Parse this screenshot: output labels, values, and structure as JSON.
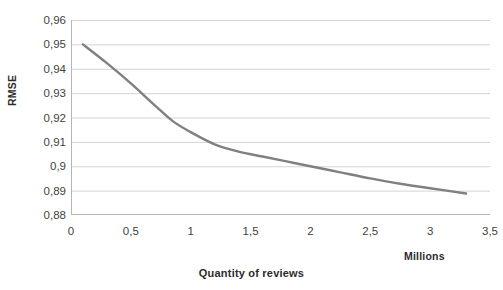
{
  "chart_data": {
    "type": "line",
    "title": "",
    "xlabel": "Quantity of reviews",
    "ylabel": "RMSE",
    "x_unit_label": "Millions",
    "xlim": [
      0,
      3.5
    ],
    "ylim": [
      0.88,
      0.96
    ],
    "grid": true,
    "legend": false,
    "x_ticks": [
      "0",
      "0,5",
      "1",
      "1,5",
      "2",
      "2,5",
      "3",
      "3,5"
    ],
    "x_tick_values": [
      0,
      0.5,
      1,
      1.5,
      2,
      2.5,
      3,
      3.5
    ],
    "y_ticks": [
      "0,96",
      "0,95",
      "0,94",
      "0,93",
      "0,92",
      "0,91",
      "0,9",
      "0,89",
      "0,88"
    ],
    "y_tick_values": [
      0.96,
      0.95,
      0.94,
      0.93,
      0.92,
      0.91,
      0.9,
      0.89,
      0.88
    ],
    "line_color": "#808080",
    "line_width": 2.4,
    "series": [
      {
        "name": "RMSE",
        "x": [
          0.1,
          0.3,
          0.5,
          0.7,
          0.85,
          1.0,
          1.2,
          1.4,
          1.6,
          1.8,
          2.0,
          2.25,
          2.5,
          2.75,
          3.0,
          3.3
        ],
        "y": [
          0.95,
          0.9423,
          0.934,
          0.925,
          0.9185,
          0.914,
          0.909,
          0.906,
          0.904,
          0.902,
          0.9,
          0.8975,
          0.895,
          0.8928,
          0.891,
          0.8888
        ]
      }
    ]
  },
  "top_caption_sliver": "",
  "axis": {
    "y_title": "RMSE",
    "x_title": "Quantity of reviews",
    "x_unit": "Millions"
  },
  "colors": {
    "line": "#808080",
    "gridline": "#d4d4d4",
    "axis": "#b5b5b5",
    "text": "#3f3f3f"
  }
}
